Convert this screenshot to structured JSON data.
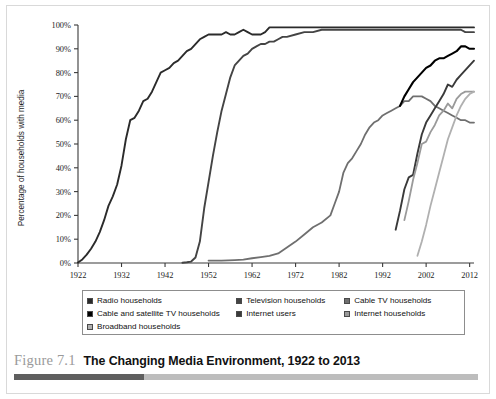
{
  "caption": {
    "figure_number": "Figure 7.1",
    "title": "The Changing Media Environment, 1922 to 2013"
  },
  "legend": {
    "items": [
      {
        "label": "Radio households",
        "color": "#2b2b2b"
      },
      {
        "label": "Television households",
        "color": "#444444"
      },
      {
        "label": "Cable TV households",
        "color": "#6f6f6f"
      },
      {
        "label": "Cable and satellite TV households",
        "color": "#000000"
      },
      {
        "label": "Internet users",
        "color": "#3a3a3a"
      },
      {
        "label": "Internet households",
        "color": "#9a9a9a"
      },
      {
        "label": "Broadband households",
        "color": "#b0b0b0"
      }
    ]
  },
  "chart_data": {
    "type": "line",
    "title": "The Changing Media Environment, 1922 to 2013",
    "xlabel": "",
    "ylabel": "Percentage of households with media",
    "xlim": [
      1922,
      2013
    ],
    "ylim": [
      0,
      100
    ],
    "grid": false,
    "legend_position": "below",
    "xticks": [
      1922,
      1932,
      1942,
      1952,
      1962,
      1972,
      1982,
      1992,
      2002,
      2012
    ],
    "yticks": [
      0,
      10,
      20,
      30,
      40,
      50,
      60,
      70,
      80,
      90,
      100
    ],
    "ytick_labels": [
      "0%",
      "10%",
      "20%",
      "30%",
      "40%",
      "50%",
      "60%",
      "70%",
      "80%",
      "90%",
      "100%"
    ],
    "series": [
      {
        "name": "Radio households",
        "color": "#2b2b2b",
        "width": 1.9,
        "points": [
          [
            1922,
            0.2
          ],
          [
            1923,
            1.5
          ],
          [
            1924,
            3.5
          ],
          [
            1925,
            6
          ],
          [
            1926,
            9
          ],
          [
            1927,
            13
          ],
          [
            1928,
            18
          ],
          [
            1929,
            24
          ],
          [
            1930,
            28
          ],
          [
            1931,
            33
          ],
          [
            1932,
            41
          ],
          [
            1933,
            52
          ],
          [
            1934,
            60
          ],
          [
            1935,
            61
          ],
          [
            1936,
            64
          ],
          [
            1937,
            68
          ],
          [
            1938,
            69
          ],
          [
            1939,
            72
          ],
          [
            1940,
            76
          ],
          [
            1941,
            80
          ],
          [
            1942,
            81
          ],
          [
            1943,
            82
          ],
          [
            1944,
            84
          ],
          [
            1945,
            85
          ],
          [
            1946,
            87
          ],
          [
            1947,
            89
          ],
          [
            1948,
            90
          ],
          [
            1949,
            92
          ],
          [
            1950,
            94
          ],
          [
            1951,
            95
          ],
          [
            1952,
            96
          ],
          [
            1953,
            96
          ],
          [
            1954,
            96
          ],
          [
            1955,
            96
          ],
          [
            1956,
            97
          ],
          [
            1957,
            96
          ],
          [
            1958,
            96
          ],
          [
            1959,
            97
          ],
          [
            1960,
            98
          ],
          [
            1961,
            97
          ],
          [
            1962,
            96
          ],
          [
            1963,
            96
          ],
          [
            1964,
            96
          ],
          [
            1965,
            97
          ],
          [
            1966,
            99
          ],
          [
            1967,
            99
          ],
          [
            1970,
            99
          ],
          [
            1975,
            99
          ],
          [
            1980,
            99
          ],
          [
            1985,
            99
          ],
          [
            1990,
            99
          ],
          [
            1995,
            99
          ],
          [
            2000,
            99
          ],
          [
            2005,
            99
          ],
          [
            2010,
            99
          ],
          [
            2013,
            99
          ]
        ]
      },
      {
        "name": "Television households",
        "color": "#444444",
        "width": 1.9,
        "points": [
          [
            1946,
            0.1
          ],
          [
            1947,
            0.3
          ],
          [
            1948,
            0.6
          ],
          [
            1949,
            2.3
          ],
          [
            1950,
            9
          ],
          [
            1951,
            23
          ],
          [
            1952,
            34
          ],
          [
            1953,
            45
          ],
          [
            1954,
            55
          ],
          [
            1955,
            64
          ],
          [
            1956,
            71
          ],
          [
            1957,
            78
          ],
          [
            1958,
            83
          ],
          [
            1959,
            85
          ],
          [
            1960,
            87
          ],
          [
            1961,
            88
          ],
          [
            1962,
            90
          ],
          [
            1963,
            91
          ],
          [
            1964,
            92
          ],
          [
            1965,
            92
          ],
          [
            1966,
            93
          ],
          [
            1967,
            93
          ],
          [
            1968,
            94
          ],
          [
            1969,
            95
          ],
          [
            1970,
            95
          ],
          [
            1972,
            96
          ],
          [
            1974,
            97
          ],
          [
            1976,
            97
          ],
          [
            1978,
            98
          ],
          [
            1980,
            98
          ],
          [
            1982,
            98
          ],
          [
            1985,
            98
          ],
          [
            1990,
            98
          ],
          [
            1995,
            98
          ],
          [
            2000,
            98
          ],
          [
            2005,
            98
          ],
          [
            2010,
            98
          ],
          [
            2011,
            97
          ],
          [
            2013,
            97
          ]
        ]
      },
      {
        "name": "Cable TV households",
        "color": "#6f6f6f",
        "width": 1.8,
        "points": [
          [
            1952,
            1
          ],
          [
            1955,
            1
          ],
          [
            1958,
            1.2
          ],
          [
            1960,
            1.4
          ],
          [
            1962,
            2
          ],
          [
            1964,
            2.5
          ],
          [
            1966,
            3
          ],
          [
            1968,
            4
          ],
          [
            1970,
            6.5
          ],
          [
            1972,
            9
          ],
          [
            1974,
            12
          ],
          [
            1976,
            15
          ],
          [
            1978,
            17
          ],
          [
            1980,
            20
          ],
          [
            1981,
            25
          ],
          [
            1982,
            30
          ],
          [
            1983,
            38
          ],
          [
            1984,
            42
          ],
          [
            1985,
            44
          ],
          [
            1986,
            47
          ],
          [
            1987,
            50
          ],
          [
            1988,
            54
          ],
          [
            1989,
            57
          ],
          [
            1990,
            59
          ],
          [
            1991,
            60
          ],
          [
            1992,
            62
          ],
          [
            1993,
            63
          ],
          [
            1994,
            64
          ],
          [
            1995,
            65
          ],
          [
            1996,
            66
          ],
          [
            1997,
            68
          ],
          [
            1998,
            68
          ],
          [
            1999,
            70
          ],
          [
            2000,
            70
          ],
          [
            2001,
            70
          ],
          [
            2002,
            69
          ],
          [
            2003,
            68
          ],
          [
            2004,
            66
          ],
          [
            2005,
            65
          ],
          [
            2006,
            64
          ],
          [
            2007,
            63
          ],
          [
            2008,
            62
          ],
          [
            2009,
            61
          ],
          [
            2010,
            60
          ],
          [
            2011,
            60
          ],
          [
            2012,
            59
          ],
          [
            2013,
            59
          ]
        ]
      },
      {
        "name": "Cable and satellite TV households",
        "color": "#000000",
        "width": 2.1,
        "points": [
          [
            1996,
            66
          ],
          [
            1997,
            70
          ],
          [
            1998,
            73
          ],
          [
            1999,
            76
          ],
          [
            2000,
            78
          ],
          [
            2001,
            80
          ],
          [
            2002,
            82
          ],
          [
            2003,
            83
          ],
          [
            2004,
            85
          ],
          [
            2005,
            86
          ],
          [
            2006,
            86
          ],
          [
            2007,
            87
          ],
          [
            2008,
            88
          ],
          [
            2009,
            89
          ],
          [
            2010,
            91
          ],
          [
            2011,
            91
          ],
          [
            2012,
            90
          ],
          [
            2013,
            90
          ]
        ]
      },
      {
        "name": "Internet users",
        "color": "#3a3a3a",
        "width": 1.9,
        "points": [
          [
            1995,
            14
          ],
          [
            1996,
            22
          ],
          [
            1997,
            31
          ],
          [
            1998,
            36
          ],
          [
            1999,
            37
          ],
          [
            2000,
            46
          ],
          [
            2001,
            54
          ],
          [
            2002,
            59
          ],
          [
            2003,
            62
          ],
          [
            2004,
            65
          ],
          [
            2005,
            68
          ],
          [
            2006,
            71
          ],
          [
            2007,
            75
          ],
          [
            2008,
            74
          ],
          [
            2009,
            77
          ],
          [
            2010,
            79
          ],
          [
            2011,
            81
          ],
          [
            2012,
            83
          ],
          [
            2013,
            85
          ]
        ]
      },
      {
        "name": "Internet households",
        "color": "#9a9a9a",
        "width": 1.8,
        "points": [
          [
            1997,
            18
          ],
          [
            1998,
            26
          ],
          [
            1999,
            35
          ],
          [
            2000,
            42
          ],
          [
            2001,
            50
          ],
          [
            2002,
            51
          ],
          [
            2003,
            55
          ],
          [
            2004,
            58
          ],
          [
            2005,
            62
          ],
          [
            2006,
            64
          ],
          [
            2007,
            67
          ],
          [
            2008,
            65
          ],
          [
            2009,
            69
          ],
          [
            2010,
            71
          ],
          [
            2011,
            72
          ],
          [
            2012,
            72
          ],
          [
            2013,
            72
          ]
        ]
      },
      {
        "name": "Broadband households",
        "color": "#b0b0b0",
        "width": 1.8,
        "points": [
          [
            2000,
            3
          ],
          [
            2001,
            9
          ],
          [
            2002,
            16
          ],
          [
            2003,
            24
          ],
          [
            2004,
            31
          ],
          [
            2005,
            38
          ],
          [
            2006,
            45
          ],
          [
            2007,
            52
          ],
          [
            2008,
            57
          ],
          [
            2009,
            62
          ],
          [
            2010,
            66
          ],
          [
            2011,
            69
          ],
          [
            2012,
            71
          ],
          [
            2013,
            72
          ]
        ]
      }
    ]
  }
}
